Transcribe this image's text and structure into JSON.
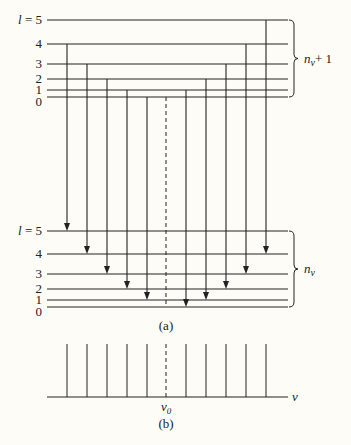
{
  "figure": {
    "upper_levels": {
      "labels": [
        "l = 5",
        "4",
        "3",
        "2",
        "1",
        "0"
      ],
      "y": [
        20,
        44,
        64,
        79,
        90,
        97
      ],
      "brace_label": "n_v + 1",
      "brace_label_main": "n",
      "brace_label_sub": "v",
      "brace_label_tail": "+ 1"
    },
    "lower_levels": {
      "labels": [
        "l = 5",
        "4",
        "3",
        "2",
        "1",
        "0"
      ],
      "y": [
        231,
        254,
        274,
        289,
        300,
        307
      ],
      "brace_label_main": "n",
      "brace_label_sub": "v"
    },
    "transitions_left": [
      {
        "x": 67,
        "from_upper": 4,
        "to_lower": 5
      },
      {
        "x": 87,
        "from_upper": 3,
        "to_lower": 4
      },
      {
        "x": 107,
        "from_upper": 2,
        "to_lower": 3
      },
      {
        "x": 127,
        "from_upper": 1,
        "to_lower": 2
      },
      {
        "x": 147,
        "from_upper": 0,
        "to_lower": 1
      }
    ],
    "transitions_right": [
      {
        "x": 186,
        "from_upper": 1,
        "to_lower": 0
      },
      {
        "x": 206,
        "from_upper": 2,
        "to_lower": 1
      },
      {
        "x": 226,
        "from_upper": 3,
        "to_lower": 2
      },
      {
        "x": 246,
        "from_upper": 4,
        "to_lower": 3
      },
      {
        "x": 266,
        "from_upper": 5,
        "to_lower": 4
      }
    ],
    "center_x": 166,
    "caption_a": "(a)",
    "spectrum": {
      "line_x": [
        67,
        87,
        107,
        127,
        147,
        186,
        206,
        226,
        246,
        266
      ],
      "center_label_main": "v",
      "center_label_sub": "0",
      "axis_label": "v"
    },
    "caption_b": "(b)"
  }
}
